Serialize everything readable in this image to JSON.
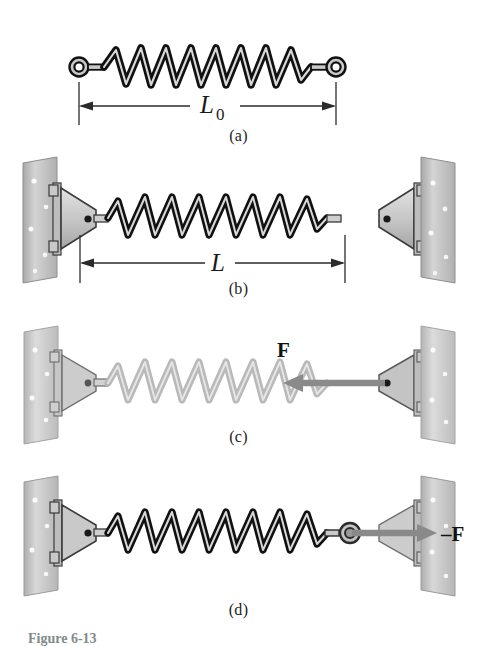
{
  "figure": {
    "caption": "Figure 6-13",
    "panels": [
      {
        "id": "a",
        "label": "(a)",
        "state": "relaxed spring, unattached",
        "dimension_label": "L",
        "dimension_subscript": "0",
        "spring_color": "#111111",
        "spring_coils": 6,
        "has_eyelets": true,
        "has_walls": false,
        "force_label": ""
      },
      {
        "id": "b",
        "label": "(b)",
        "state": "stretched spring between two wall brackets",
        "dimension_label": "L",
        "dimension_subscript": "",
        "spring_color": "#111111",
        "spring_coils": 6,
        "has_eyelets": false,
        "has_walls": true,
        "force_label": ""
      },
      {
        "id": "c",
        "label": "(c)",
        "state": "faded spring with applied force on right bracket",
        "dimension_label": "",
        "dimension_subscript": "",
        "spring_color": "#b9b9b9",
        "spring_coils": 6,
        "has_eyelets": false,
        "has_walls": true,
        "force_label": "F"
      },
      {
        "id": "d",
        "label": "(d)",
        "state": "spring with reaction force pointing right",
        "dimension_label": "",
        "dimension_subscript": "",
        "spring_color": "#111111",
        "spring_coils": 6,
        "has_eyelets": true,
        "has_walls": true,
        "force_label": "–F"
      }
    ]
  },
  "colors": {
    "spring_dark": "#111111",
    "spring_light": "#b9b9b9",
    "spring_highlight": "#d8d8d8",
    "wall_fill": "#c2c2c2",
    "wall_edge": "#8e8e8e",
    "bracket_fill": "#c9c9c9",
    "bracket_edge": "#3b3b3b",
    "arrow_gray": "#8a8a8a",
    "dimension_line": "#2b2b2b",
    "text": "#1a1a1a",
    "caption_text": "#7f8c8d",
    "background": "#ffffff"
  }
}
